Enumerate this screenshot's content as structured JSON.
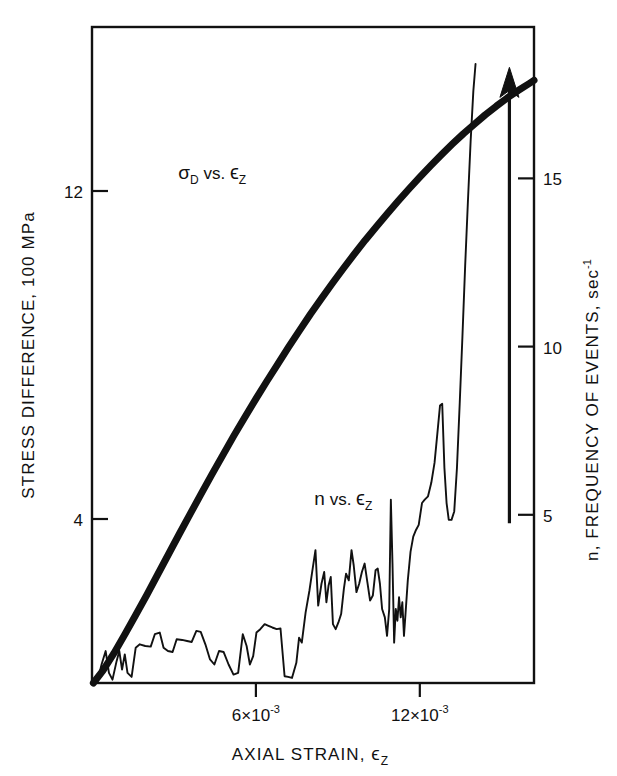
{
  "chart_data": {
    "type": "line",
    "title": "",
    "xlabel": "AXIAL STRAIN, ϵz",
    "xlabel_main": "AXIAL STRAIN, ",
    "xlabel_symbol": "ϵ",
    "xlabel_sub": "Z",
    "ylabel_left": "STRESS DIFFERENCE, 100 MPa",
    "ylabel_right": "n, FREQUENCY OF EVENTS, sec",
    "ylabel_right_sup": "-1",
    "grid": false,
    "legend": "inline-annotations",
    "xlim": [
      0,
      0.01618
    ],
    "ylim_left": [
      0,
      16.0
    ],
    "ylim_right": [
      0,
      19.5
    ],
    "x_ticks": [
      {
        "value": 0.006,
        "label_main": "6×10",
        "label_sup": "-3"
      },
      {
        "value": 0.012,
        "label_main": "12×10",
        "label_sup": "-3"
      }
    ],
    "y_ticks_left": [
      {
        "value": 12,
        "label": "12"
      },
      {
        "value": 4,
        "label": "4"
      }
    ],
    "y_ticks_right": [
      {
        "value": 15,
        "label": "15"
      },
      {
        "value": 10,
        "label": "10"
      },
      {
        "value": 5,
        "label": "5"
      }
    ],
    "annotations": [
      {
        "name": "stress-series-label",
        "text_main": "σ",
        "text_sub": "D",
        "text_mid": " vs. ",
        "text_sym": "ϵ",
        "text_sym_sub": "Z",
        "x": 0.0044,
        "y_left": 12.3
      },
      {
        "name": "frequency-series-label",
        "text_main": "n",
        "text_sub": "",
        "text_mid": " vs. ",
        "text_sym": "ϵ",
        "text_sym_sub": "Z",
        "x": 0.0092,
        "y_left": 4.35
      }
    ],
    "arrow": {
      "name": "failure-arrow",
      "x": 0.01528,
      "y_bottom_right": 4.75,
      "y_tip_right": 18.3,
      "description": "upward arrow at failure"
    },
    "series": [
      {
        "name": "σD vs. ϵz",
        "axis": "left",
        "style": "thick-solid",
        "points": [
          [
            5e-05,
            0.0
          ],
          [
            0.0004,
            0.3
          ],
          [
            0.0008,
            0.72
          ],
          [
            0.0012,
            1.18
          ],
          [
            0.0016,
            1.66
          ],
          [
            0.002,
            2.14
          ],
          [
            0.0024,
            2.64
          ],
          [
            0.0028,
            3.14
          ],
          [
            0.0032,
            3.64
          ],
          [
            0.0036,
            4.13
          ],
          [
            0.004,
            4.62
          ],
          [
            0.0044,
            5.1
          ],
          [
            0.0048,
            5.57
          ],
          [
            0.0052,
            6.04
          ],
          [
            0.0056,
            6.49
          ],
          [
            0.006,
            6.93
          ],
          [
            0.0064,
            7.36
          ],
          [
            0.0068,
            7.78
          ],
          [
            0.0072,
            8.2
          ],
          [
            0.0076,
            8.6
          ],
          [
            0.008,
            9.0
          ],
          [
            0.0084,
            9.38
          ],
          [
            0.0088,
            9.75
          ],
          [
            0.0092,
            10.11
          ],
          [
            0.0096,
            10.46
          ],
          [
            0.01,
            10.8
          ],
          [
            0.0104,
            11.12
          ],
          [
            0.0108,
            11.44
          ],
          [
            0.0112,
            11.75
          ],
          [
            0.0116,
            12.05
          ],
          [
            0.012,
            12.34
          ],
          [
            0.0124,
            12.62
          ],
          [
            0.0128,
            12.89
          ],
          [
            0.0132,
            13.15
          ],
          [
            0.0136,
            13.4
          ],
          [
            0.014,
            13.63
          ],
          [
            0.0144,
            13.86
          ],
          [
            0.0148,
            14.07
          ],
          [
            0.0152,
            14.27
          ],
          [
            0.0156,
            14.45
          ],
          [
            0.016,
            14.62
          ],
          [
            0.01618,
            14.7
          ]
        ]
      },
      {
        "name": "n vs. ϵz",
        "axis": "right",
        "style": "thin-jagged",
        "points": [
          [
            5e-05,
            0.0
          ],
          [
            0.0002,
            0.05
          ],
          [
            0.00035,
            0.55
          ],
          [
            0.0005,
            0.95
          ],
          [
            0.00062,
            0.3
          ],
          [
            0.00075,
            0.1
          ],
          [
            0.0009,
            0.65
          ],
          [
            0.001,
            0.95
          ],
          [
            0.0011,
            0.4
          ],
          [
            0.0012,
            0.85
          ],
          [
            0.0013,
            0.3
          ],
          [
            0.00145,
            0.18
          ],
          [
            0.0016,
            1.05
          ],
          [
            0.00175,
            1.15
          ],
          [
            0.00195,
            1.1
          ],
          [
            0.00215,
            1.08
          ],
          [
            0.0023,
            1.45
          ],
          [
            0.00248,
            1.5
          ],
          [
            0.00262,
            1.05
          ],
          [
            0.00278,
            0.95
          ],
          [
            0.00295,
            0.92
          ],
          [
            0.0031,
            1.3
          ],
          [
            0.0033,
            1.28
          ],
          [
            0.00348,
            1.25
          ],
          [
            0.00365,
            1.22
          ],
          [
            0.00382,
            1.55
          ],
          [
            0.00398,
            1.52
          ],
          [
            0.00415,
            1.15
          ],
          [
            0.00432,
            0.7
          ],
          [
            0.00448,
            0.55
          ],
          [
            0.00465,
            0.95
          ],
          [
            0.00482,
            0.92
          ],
          [
            0.005,
            0.55
          ],
          [
            0.00518,
            0.25
          ],
          [
            0.00535,
            0.3
          ],
          [
            0.00552,
            1.45
          ],
          [
            0.00566,
            1.1
          ],
          [
            0.00578,
            0.55
          ],
          [
            0.0059,
            0.8
          ],
          [
            0.00602,
            1.5
          ],
          [
            0.00616,
            1.6
          ],
          [
            0.00632,
            1.75
          ],
          [
            0.00646,
            1.7
          ],
          [
            0.0066,
            1.65
          ],
          [
            0.00676,
            1.6
          ],
          [
            0.0069,
            1.62
          ],
          [
            0.00705,
            0.2
          ],
          [
            0.00718,
            0.18
          ],
          [
            0.00732,
            0.15
          ],
          [
            0.00748,
            0.6
          ],
          [
            0.00758,
            1.35
          ],
          [
            0.00768,
            1.2
          ],
          [
            0.00782,
            2.1
          ],
          [
            0.00796,
            2.75
          ],
          [
            0.00806,
            3.3
          ],
          [
            0.00818,
            3.95
          ],
          [
            0.00828,
            2.3
          ],
          [
            0.0084,
            2.95
          ],
          [
            0.0085,
            3.3
          ],
          [
            0.00858,
            2.4
          ],
          [
            0.00866,
            2.9
          ],
          [
            0.00874,
            3.15
          ],
          [
            0.00882,
            1.75
          ],
          [
            0.00892,
            1.6
          ],
          [
            0.00902,
            1.8
          ],
          [
            0.00912,
            2.05
          ],
          [
            0.00922,
            2.8
          ],
          [
            0.0093,
            3.25
          ],
          [
            0.0094,
            3.05
          ],
          [
            0.0095,
            3.95
          ],
          [
            0.00958,
            3.5
          ],
          [
            0.00968,
            2.7
          ],
          [
            0.00978,
            2.95
          ],
          [
            0.00988,
            3.3
          ],
          [
            0.00998,
            3.55
          ],
          [
            0.01008,
            3.0
          ],
          [
            0.01018,
            2.45
          ],
          [
            0.01028,
            2.6
          ],
          [
            0.01038,
            3.35
          ],
          [
            0.01046,
            3.4
          ],
          [
            0.01054,
            2.95
          ],
          [
            0.01062,
            2.2
          ],
          [
            0.01072,
            1.95
          ],
          [
            0.0108,
            1.4
          ],
          [
            0.01088,
            2.2
          ],
          [
            0.01094,
            5.45
          ],
          [
            0.011,
            3.55
          ],
          [
            0.01106,
            1.2
          ],
          [
            0.01112,
            2.2
          ],
          [
            0.01118,
            1.85
          ],
          [
            0.01124,
            2.55
          ],
          [
            0.0113,
            1.95
          ],
          [
            0.01136,
            2.4
          ],
          [
            0.01142,
            1.4
          ],
          [
            0.01148,
            2.1
          ],
          [
            0.01156,
            3.05
          ],
          [
            0.01166,
            3.9
          ],
          [
            0.01176,
            4.35
          ],
          [
            0.01186,
            4.55
          ],
          [
            0.01196,
            4.7
          ],
          [
            0.01208,
            5.35
          ],
          [
            0.01218,
            5.45
          ],
          [
            0.0123,
            5.55
          ],
          [
            0.01242,
            5.95
          ],
          [
            0.01254,
            6.55
          ],
          [
            0.01264,
            7.4
          ],
          [
            0.01274,
            8.25
          ],
          [
            0.01282,
            8.3
          ],
          [
            0.0129,
            6.4
          ],
          [
            0.01298,
            5.35
          ],
          [
            0.01306,
            4.85
          ],
          [
            0.01316,
            4.85
          ],
          [
            0.01326,
            5.1
          ],
          [
            0.01336,
            6.4
          ],
          [
            0.01346,
            8.3
          ],
          [
            0.01356,
            10.3
          ],
          [
            0.01366,
            12.4
          ],
          [
            0.01376,
            14.3
          ],
          [
            0.01386,
            16.1
          ],
          [
            0.01396,
            17.6
          ],
          [
            0.01404,
            18.4
          ]
        ]
      }
    ]
  },
  "plot_geometry": {
    "left_px": 92,
    "right_px": 534,
    "top_px": 27,
    "bottom_px": 683,
    "x_min": 0,
    "x_max": 0.01618,
    "left_y_min": 0,
    "left_y_max": 16.0,
    "right_y_min": 0,
    "right_y_max": 19.5
  },
  "colors": {
    "ink": "#111111",
    "background": "#ffffff"
  }
}
